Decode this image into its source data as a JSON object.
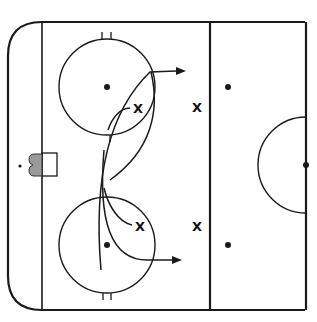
{
  "diagram": {
    "type": "hockey-drill",
    "colors": {
      "line": "#1a1a1a",
      "background": "#ffffff",
      "net": "#8a8a8a"
    },
    "players": [
      {
        "id": "p1",
        "label": "X",
        "x": 138,
        "y": 108
      },
      {
        "id": "p2",
        "label": "X",
        "x": 197,
        "y": 107
      },
      {
        "id": "p3",
        "label": "X",
        "x": 140,
        "y": 226
      },
      {
        "id": "p4",
        "label": "X",
        "x": 197,
        "y": 226
      }
    ],
    "faceoff_dots": [
      {
        "x": 107,
        "y": 87
      },
      {
        "x": 107,
        "y": 245
      },
      {
        "x": 228,
        "y": 87
      },
      {
        "x": 228,
        "y": 245
      },
      {
        "x": 306,
        "y": 165
      }
    ]
  }
}
